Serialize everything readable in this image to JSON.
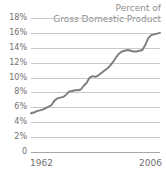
{
  "chart_data": {
    "type": "line",
    "title": "Percent of Gross Domestic Product",
    "title_lines": [
      "Percent of",
      "Gross Domestic Product"
    ],
    "xlabel": "",
    "ylabel": "",
    "xlim": [
      1962,
      2006
    ],
    "ylim": [
      0,
      18
    ],
    "grid": true,
    "legend": "none",
    "line_color": "#7d7d7d",
    "grid_color": "#c9c9c9",
    "text_color": "#6f6f6f",
    "title_color": "#8d8d8d",
    "y_ticks": [
      "0",
      "2%",
      "4%",
      "6%",
      "8%",
      "10%",
      "12%",
      "14%",
      "16%",
      "18%"
    ],
    "y_tick_values": [
      0,
      2,
      4,
      6,
      8,
      10,
      12,
      14,
      16,
      18
    ],
    "x_ticks": [
      "1962",
      "2006"
    ],
    "x_tick_values": [
      1962,
      2006
    ],
    "series": [
      {
        "name": "Percent of Gross Domestic Product",
        "x": [
          1962,
          1963,
          1964,
          1965,
          1966,
          1967,
          1968,
          1969,
          1970,
          1971,
          1972,
          1973,
          1974,
          1975,
          1976,
          1977,
          1978,
          1979,
          1980,
          1981,
          1982,
          1983,
          1984,
          1985,
          1986,
          1987,
          1988,
          1989,
          1990,
          1991,
          1992,
          1993,
          1994,
          1995,
          1996,
          1997,
          1998,
          1999,
          2000,
          2001,
          2002,
          2003,
          2004,
          2005,
          2006
        ],
        "values": [
          5.2,
          5.3,
          5.5,
          5.6,
          5.7,
          5.9,
          6.1,
          6.3,
          6.9,
          7.2,
          7.3,
          7.4,
          7.7,
          8.1,
          8.2,
          8.3,
          8.3,
          8.4,
          8.9,
          9.3,
          10.0,
          10.2,
          10.1,
          10.3,
          10.6,
          10.9,
          11.2,
          11.6,
          12.1,
          12.7,
          13.2,
          13.5,
          13.6,
          13.7,
          13.6,
          13.5,
          13.5,
          13.6,
          13.7,
          14.4,
          15.3,
          15.7,
          15.8,
          15.9,
          16.0
        ]
      }
    ]
  }
}
